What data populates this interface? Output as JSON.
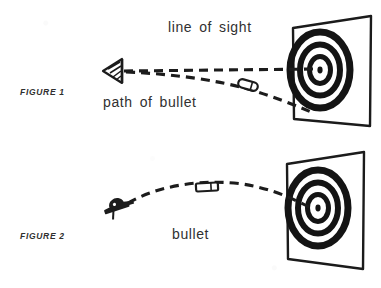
{
  "page": {
    "background_color": "#ffffff",
    "ink_color": "#1f1f1f",
    "width": 381,
    "height": 288
  },
  "figures": [
    {
      "id": "figure-1",
      "caption": "FIGURE 1",
      "annotations": [
        {
          "name": "line-of-sight-label",
          "text": "line of sight"
        },
        {
          "name": "path-of-bullet-label",
          "text": "path of bullet"
        }
      ],
      "elements": [
        {
          "name": "eye-sight-icon",
          "text": "eye"
        },
        {
          "name": "bullet-icon",
          "text": "bullet"
        },
        {
          "name": "target-panel",
          "text": "target"
        },
        {
          "name": "line-of-sight-path",
          "text": "straight dashed line"
        },
        {
          "name": "bullet-trajectory-path",
          "text": "curved dashed line"
        }
      ]
    },
    {
      "id": "figure-2",
      "caption": "FIGURE 2",
      "annotations": [
        {
          "name": "bullet-label",
          "text": "bullet"
        }
      ],
      "elements": [
        {
          "name": "gun-icon",
          "text": "gun"
        },
        {
          "name": "bullet-icon",
          "text": "bullet"
        },
        {
          "name": "target-panel",
          "text": "target"
        },
        {
          "name": "bullet-trajectory-path",
          "text": "arced dashed line"
        }
      ]
    }
  ],
  "target": {
    "ring_count": 4,
    "ring_color": "#141414",
    "field_color": "#ffffff"
  }
}
